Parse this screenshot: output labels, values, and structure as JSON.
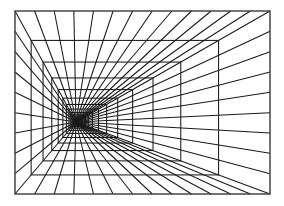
{
  "figure": {
    "background_color": "#ffffff",
    "line_color": "#1a1a1a",
    "frame_color": "#3a3a3a"
  },
  "chart_data": {
    "type": "line",
    "xlabel": "",
    "ylabel": "",
    "xlim": [
      0,
      284
    ],
    "ylim": [
      0,
      206
    ],
    "grid": false,
    "legend": "none",
    "canvas": {
      "width": 284,
      "height": 206
    },
    "outer_frame": {
      "x": 15,
      "y": 11,
      "width": 255,
      "height": 183
    },
    "vanishing_point": {
      "x": 76,
      "y": 122
    },
    "nested_rectangles": {
      "count": 12,
      "scale_factor": 0.735,
      "note": "Each rectangle is the outer frame scaled toward the vanishing point by the cumulative scale factor.",
      "scales": [
        1.0,
        0.735,
        0.54,
        0.397,
        0.292,
        0.215,
        0.158,
        0.116,
        0.085,
        0.063,
        0.046,
        0.034
      ]
    },
    "radial_lines": {
      "total": 40,
      "top_edge_count": 12,
      "bottom_edge_count": 12,
      "left_edge_count": 8,
      "right_edge_count": 8,
      "note": "Lines run from the vanishing point outward to evenly spaced points along the perimeter of the outer frame."
    }
  }
}
